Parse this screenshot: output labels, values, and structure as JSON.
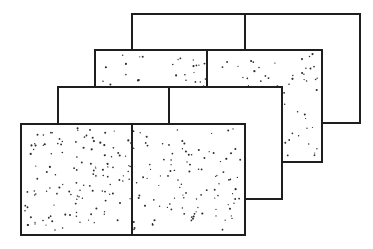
{
  "diagram": {
    "title": "",
    "stroke_color": "#1e1e1e",
    "stroke_width": 2,
    "dot_color": "#2a2a2a",
    "panels": [
      {
        "id": "panel-1",
        "x": 132,
        "y": 14,
        "w": 228,
        "h": 109,
        "divider_x": 245,
        "fill": "blank"
      },
      {
        "id": "panel-2",
        "x": 95,
        "y": 50,
        "w": 227,
        "h": 112,
        "divider_x": 207,
        "fill": "stippled",
        "dots": 150,
        "seed": 7
      },
      {
        "id": "panel-3",
        "x": 58,
        "y": 87,
        "w": 224,
        "h": 112,
        "divider_x": 169,
        "fill": "blank"
      },
      {
        "id": "panel-4",
        "x": 21,
        "y": 124,
        "w": 224,
        "h": 111,
        "divider_x": 132,
        "fill": "stippled",
        "dots": 230,
        "seed": 19
      }
    ]
  }
}
